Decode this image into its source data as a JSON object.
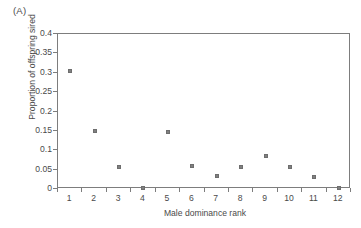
{
  "panel": {
    "label": "(A)"
  },
  "chart_data": {
    "type": "scatter",
    "title": "(A)",
    "xlabel": "Male dominance rank",
    "ylabel": "Proportion of offspring sired",
    "x": [
      1,
      2,
      3,
      4,
      5,
      6,
      7,
      8,
      9,
      10,
      11,
      12
    ],
    "values": [
      0.305,
      0.15,
      0.058,
      0.002,
      0.148,
      0.06,
      0.033,
      0.058,
      0.085,
      0.057,
      0.03,
      0.002
    ],
    "categories": [
      "1",
      "2",
      "3",
      "4",
      "5",
      "6",
      "7",
      "8",
      "9",
      "10",
      "11",
      "12"
    ],
    "xlim": [
      0.5,
      12.5
    ],
    "ylim": [
      0,
      0.4
    ],
    "yticks": [
      0,
      0.05,
      0.1,
      0.15,
      0.2,
      0.25,
      0.3,
      0.35,
      0.4
    ],
    "ytick_labels": [
      "0",
      "0.05",
      "0.1",
      "0.15",
      "0.2",
      "0.25",
      "0.3",
      "0.35",
      "0.4"
    ],
    "xtick_labels": [
      "1",
      "2",
      "3",
      "4",
      "5",
      "6",
      "7",
      "8",
      "9",
      "10",
      "11",
      "12"
    ],
    "grid": false,
    "legend": null,
    "marker": "square",
    "marker_color": "#808080",
    "frame_color": "#7d7d7d"
  }
}
